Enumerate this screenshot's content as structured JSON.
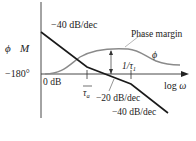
{
  "diagram": {
    "type": "bode-plot",
    "y_axis_labels": {
      "phase": "ϕ",
      "magnitude": "M"
    },
    "x_axis_label": "log ω",
    "phase_reference": "−180°",
    "gain_reference": "0 dB",
    "annotations": {
      "initial_slope": "−40 dB/dec",
      "middle_slope": "−20 dB/dec",
      "final_slope": "−40 dB/dec",
      "phase_margin": "Phase margin",
      "phase_curve": "ϕ"
    },
    "corner_frequencies": [
      {
        "label": "1/τa",
        "numerator": "1",
        "denominator": "τ",
        "subscript": "a"
      },
      {
        "label": "1/τ1",
        "text": "1/τ",
        "subscript": "1"
      }
    ],
    "colors": {
      "magnitude_line": "#1a1a1a",
      "phase_curve": "#8a8a8a",
      "axes": "#333333",
      "leader_line": "#999999"
    }
  }
}
